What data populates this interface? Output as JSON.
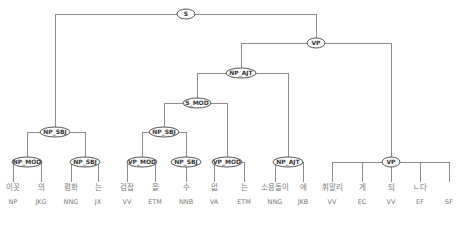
{
  "diagram": {
    "type": "dependency-phrase-tree",
    "root": "S",
    "nodes": [
      {
        "id": "s",
        "label": "S",
        "x": 186,
        "y": 14,
        "w": 18
      },
      {
        "id": "vp1",
        "label": "VP",
        "x": 316,
        "y": 43,
        "w": 18
      },
      {
        "id": "np_ajt1",
        "label": "NP_AJT",
        "x": 241,
        "y": 73,
        "w": 30
      },
      {
        "id": "s_mod",
        "label": "S_MOD",
        "x": 197,
        "y": 103,
        "w": 28
      },
      {
        "id": "np_sbj1",
        "label": "NP_SBJ",
        "x": 55,
        "y": 132,
        "w": 30
      },
      {
        "id": "np_sbj2",
        "label": "NP_SBJ",
        "x": 164,
        "y": 132,
        "w": 30
      },
      {
        "id": "np_mod",
        "label": "NP_MOD",
        "x": 27,
        "y": 162,
        "w": 30
      },
      {
        "id": "np_sbj3",
        "label": "NP_SBJ",
        "x": 85,
        "y": 162,
        "w": 30
      },
      {
        "id": "vp_mod1",
        "label": "VP_MOD",
        "x": 142,
        "y": 162,
        "w": 30
      },
      {
        "id": "np_sbj4",
        "label": "NP_SBJ",
        "x": 186,
        "y": 162,
        "w": 30
      },
      {
        "id": "vp_mod2",
        "label": "VP_MOD",
        "x": 227,
        "y": 162,
        "w": 30
      },
      {
        "id": "np_ajt2",
        "label": "NP_AJT",
        "x": 288,
        "y": 162,
        "w": 30
      },
      {
        "id": "vp2",
        "label": "VP",
        "x": 391,
        "y": 162,
        "w": 18
      }
    ],
    "brackets": [
      {
        "parent": "s",
        "y": 14,
        "x1": 55,
        "x2": 316,
        "drops": [
          [
            55,
            132
          ],
          [
            316,
            43
          ]
        ]
      },
      {
        "parent": "vp1",
        "y": 43,
        "x1": 241,
        "x2": 391,
        "drops": [
          [
            241,
            73
          ],
          [
            391,
            162
          ]
        ]
      },
      {
        "parent": "np_ajt1",
        "y": 73,
        "x1": 197,
        "x2": 288,
        "drops": [
          [
            197,
            103
          ],
          [
            288,
            162
          ]
        ]
      },
      {
        "parent": "s_mod",
        "y": 103,
        "x1": 164,
        "x2": 227,
        "drops": [
          [
            164,
            132
          ],
          [
            227,
            162
          ]
        ]
      },
      {
        "parent": "np_sbj1",
        "y": 132,
        "x1": 27,
        "x2": 85,
        "drops": [
          [
            27,
            162
          ],
          [
            85,
            162
          ]
        ]
      },
      {
        "parent": "np_sbj2",
        "y": 132,
        "x1": 142,
        "x2": 186,
        "drops": [
          [
            142,
            162
          ],
          [
            186,
            162
          ]
        ]
      },
      {
        "parent": "np_mod",
        "y": 162,
        "x1": 13,
        "x2": 41,
        "drops": [
          [
            13,
            182
          ],
          [
            41,
            182
          ]
        ]
      },
      {
        "parent": "np_sbj3",
        "y": 162,
        "x1": 71,
        "x2": 98,
        "drops": [
          [
            71,
            182
          ],
          [
            98,
            182
          ]
        ]
      },
      {
        "parent": "vp_mod1",
        "y": 162,
        "x1": 127,
        "x2": 155,
        "drops": [
          [
            127,
            182
          ],
          [
            155,
            182
          ]
        ]
      },
      {
        "parent": "np_sbj4",
        "y": 162,
        "x1": 186,
        "x2": 186,
        "drops": [
          [
            186,
            182
          ]
        ]
      },
      {
        "parent": "vp_mod2",
        "y": 162,
        "x1": 214,
        "x2": 244,
        "drops": [
          [
            214,
            182
          ],
          [
            244,
            182
          ]
        ]
      },
      {
        "parent": "np_ajt2",
        "y": 162,
        "x1": 275,
        "x2": 303,
        "drops": [
          [
            275,
            182
          ],
          [
            303,
            182
          ]
        ]
      },
      {
        "parent": "vp2",
        "y": 162,
        "x1": 332,
        "x2": 449,
        "drops": [
          [
            332,
            182
          ],
          [
            362,
            182
          ],
          [
            391,
            182
          ],
          [
            420,
            182
          ],
          [
            449,
            182
          ]
        ]
      }
    ],
    "tokens": [
      {
        "word": "이꼿",
        "tag": "NP",
        "x": 13
      },
      {
        "word": "의",
        "tag": "JKG",
        "x": 41
      },
      {
        "word": "평화",
        "tag": "NNG",
        "x": 71
      },
      {
        "word": "는",
        "tag": "JX",
        "x": 98
      },
      {
        "word": "검잡",
        "tag": "VV",
        "x": 127
      },
      {
        "word": "을",
        "tag": "ETM",
        "x": 155
      },
      {
        "word": "수",
        "tag": "NNB",
        "x": 186
      },
      {
        "word": "없",
        "tag": "VA",
        "x": 214
      },
      {
        "word": "는",
        "tag": "ETM",
        "x": 244
      },
      {
        "word": "소용돌이",
        "tag": "NNG",
        "x": 275
      },
      {
        "word": "에",
        "tag": "JKB",
        "x": 303
      },
      {
        "word": "휘말리",
        "tag": "VV",
        "x": 332
      },
      {
        "word": "게",
        "tag": "EC",
        "x": 362
      },
      {
        "word": "되",
        "tag": "VV",
        "x": 391
      },
      {
        "word": "ㄴ다",
        "tag": "EF",
        "x": 420
      },
      {
        "word": "",
        "tag": "SF",
        "x": 449
      }
    ],
    "word_y": 190,
    "tag_y": 204
  },
  "colors": {
    "edge": "#8c8c8c",
    "node_border": "#555555",
    "node_text": "#333333",
    "token_text": "#7a7a7a",
    "background": "#ffffff"
  }
}
